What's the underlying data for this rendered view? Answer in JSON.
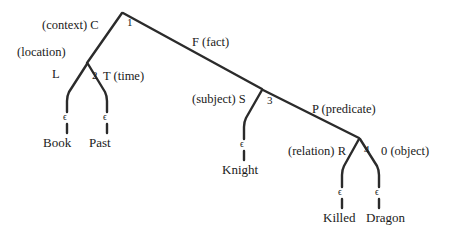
{
  "diagram": {
    "type": "tree-diagram",
    "stroke_color": "#2b2b2b",
    "text_color": "#1a1a1a",
    "background_color": "#ffffff",
    "empty_symbol": "ϵ",
    "nodes": [
      {
        "id": "n1",
        "number": "1",
        "x": 122,
        "y": 12
      },
      {
        "id": "n2",
        "number": "2",
        "x": 87,
        "y": 63
      },
      {
        "id": "n3",
        "number": "3",
        "x": 262,
        "y": 88
      },
      {
        "id": "n4",
        "number": "4",
        "x": 359,
        "y": 137
      }
    ],
    "node_labels": {
      "n1": "1",
      "n2": "2",
      "n3": "3",
      "n4": "4"
    },
    "edge_labels": {
      "context": "(context) C",
      "fact": "F (fact)",
      "location": "(location)",
      "location_symbol": "L",
      "time": "T (time)",
      "subject": "(subject) S",
      "predicate": "P (predicate)",
      "relation": "(relation) R",
      "object": "0 (object)"
    },
    "leaves": [
      {
        "id": "leaf-book",
        "word": "Book",
        "epsilon": "ϵ"
      },
      {
        "id": "leaf-past",
        "word": "Past",
        "epsilon": "ϵ"
      },
      {
        "id": "leaf-knight",
        "word": "Knight",
        "epsilon": "ϵ"
      },
      {
        "id": "leaf-killed",
        "word": "Killed",
        "epsilon": "ϵ"
      },
      {
        "id": "leaf-dragon",
        "word": "Dragon",
        "epsilon": "ϵ"
      }
    ]
  }
}
